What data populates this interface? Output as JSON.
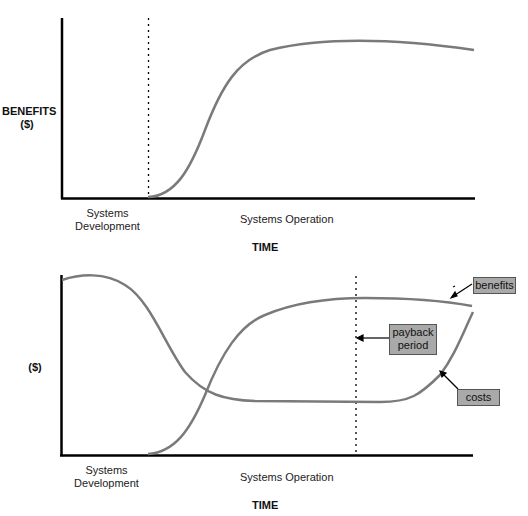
{
  "top_graph": {
    "y_label_line1": "BENEFITS",
    "y_label_line2": "($)",
    "x_phase_1_line1": "Systems",
    "x_phase_1_line2": "Development",
    "x_phase_2": "Systems Operation",
    "x_label": "TIME",
    "curves": [
      "benefits"
    ]
  },
  "bottom_graph": {
    "y_label": "($)",
    "x_phase_1_line1": "Systems",
    "x_phase_1_line2": "Development",
    "x_phase_2": "Systems Operation",
    "x_label": "TIME",
    "callouts": {
      "benefits": "benefits",
      "payback_line1": "payback",
      "payback_line2": "period",
      "costs": "costs"
    },
    "curves": [
      "benefits",
      "costs"
    ]
  },
  "colors": {
    "curve": "#7a7a7a",
    "axis": "#000000",
    "callout_fill": "#a9a9a9"
  }
}
